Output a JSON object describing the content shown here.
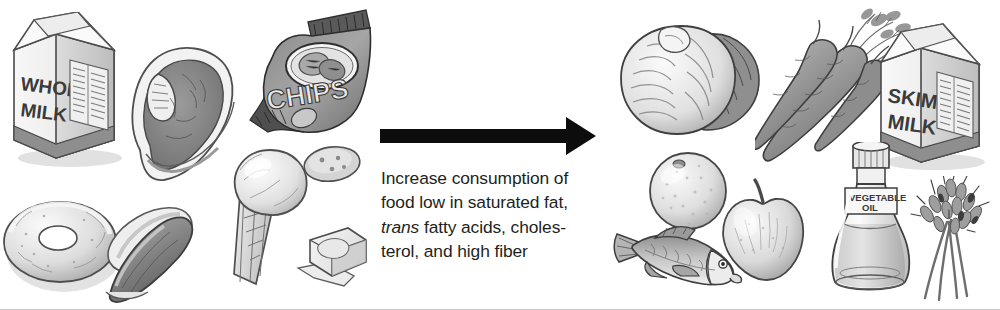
{
  "figure": {
    "name": "dietary-recommendation-figure",
    "background_color": "#ffffff",
    "width": 1000,
    "height": 310,
    "border_color": "#c9c9c9"
  },
  "caption": {
    "line1": "Increase consumption of",
    "line2": "food low in saturated fat,",
    "line3_italic": "trans",
    "line3_rest": " fatty acids, choles-",
    "line4": "terol, and high fiber",
    "full_text": "Increase consumption of food low in saturated fat, trans fatty acids, cholesterol, and high fiber",
    "text_color": "#231f20"
  },
  "arrow": {
    "name": "rightward-arrow",
    "direction": "right",
    "color": "#0d0d0d"
  },
  "left_panel": {
    "label": "high saturated fat and cholesterol foods",
    "items": [
      {
        "name": "whole-milk-carton-icon",
        "label": "Whole milk carton",
        "carton_line1": "WHOLE",
        "carton_line2": "MILK"
      },
      {
        "name": "steak-icon",
        "label": "T-bone steak"
      },
      {
        "name": "chips-bag-icon",
        "label": "Bag of potato chips",
        "bag_text": "CHIPS"
      },
      {
        "name": "donut-icon",
        "label": "Doughnut"
      },
      {
        "name": "hot-dog-icon",
        "label": "Hot dog in bun"
      },
      {
        "name": "ice-cream-cone-icon",
        "label": "Ice cream cone"
      },
      {
        "name": "butter-pat-icon",
        "label": "Pat of butter"
      },
      {
        "name": "cookie-icon",
        "label": "Cookie"
      }
    ]
  },
  "right_panel": {
    "label": "low saturated fat and high fiber foods",
    "items": [
      {
        "name": "cabbage-icon",
        "label": "Head of cabbage"
      },
      {
        "name": "carrots-icon",
        "label": "Bunch of carrots"
      },
      {
        "name": "skim-milk-carton-icon",
        "label": "Skim milk carton",
        "carton_line1": "SKIM",
        "carton_line2": "MILK"
      },
      {
        "name": "orange-icon",
        "label": "Orange"
      },
      {
        "name": "apple-icon",
        "label": "Apple"
      },
      {
        "name": "fish-icon",
        "label": "Fish"
      },
      {
        "name": "vegetable-oil-bottle-icon",
        "label": "Vegetable oil bottle",
        "bottle_line1": "VEGETABLE",
        "bottle_line2": "OIL"
      },
      {
        "name": "wheat-stalks-icon",
        "label": "Wheat stalks"
      }
    ]
  },
  "palette": {
    "ink": "#3c3c3c",
    "mid_gray": "#9a9a9a",
    "light_gray": "#d8d8d8",
    "paper": "#f2f2f2"
  }
}
